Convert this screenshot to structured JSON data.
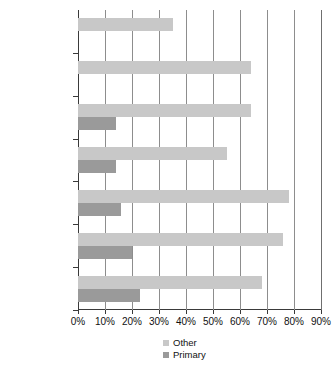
{
  "chart_data": {
    "type": "bar",
    "orientation": "horizontal",
    "title": "",
    "subtitle": "",
    "xlabel": "",
    "ylabel": "",
    "xlim": [
      0,
      90
    ],
    "xtick_labels": [
      "0%",
      "10%",
      "20%",
      "30%",
      "40%",
      "50%",
      "60%",
      "70%",
      "80%",
      "90%"
    ],
    "xtick_values": [
      0,
      10,
      20,
      30,
      40,
      50,
      60,
      70,
      80,
      90
    ],
    "grid": "vertical",
    "legend_position": "bottom-center",
    "categories": [
      "MD time for\nnonclinical\nduties",
      "Reduce\nLOS",
      "Improve\ncontinuity",
      "Physician\nproductivity",
      "Patient\nthroughput",
      "Improve\naccess",
      "ACGME\nlimits"
    ],
    "series": [
      {
        "name": "Other",
        "color": "#c8c8c8",
        "values": [
          35,
          64,
          64,
          55,
          78,
          76,
          68
        ]
      },
      {
        "name": "Primary",
        "color": "#9a9a9a",
        "values": [
          0,
          0,
          14,
          14,
          16,
          20,
          23
        ]
      }
    ]
  },
  "legend": {
    "entries": [
      {
        "label": "Other"
      },
      {
        "label": "Primary"
      }
    ]
  },
  "colors": {
    "other": "#c8c8c8",
    "primary": "#9a9a9a",
    "axis": "#3a3a3a",
    "grid": "#8d8d8d",
    "text": "#111111",
    "background": "#ffffff"
  }
}
